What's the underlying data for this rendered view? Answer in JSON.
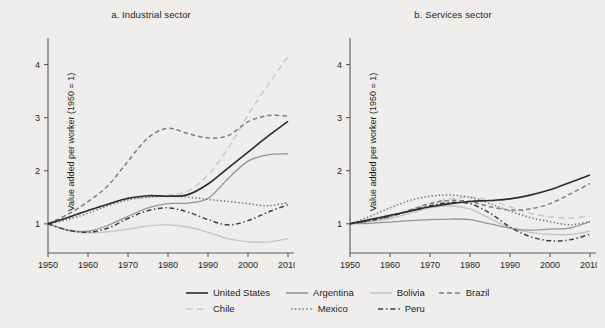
{
  "chart_data": {
    "type": "line",
    "ylabel": "Value added per worker (1950 = 1)",
    "xlabel": "",
    "xlim": [
      1950,
      2010
    ],
    "ylim": [
      0.45,
      4.35
    ],
    "yticks": [
      1,
      2,
      3,
      4
    ],
    "xticks": [
      1950,
      1960,
      1970,
      1980,
      1990,
      2000,
      2010
    ],
    "grid": false,
    "legend_position": "bottom",
    "x": [
      1950,
      1955,
      1960,
      1965,
      1970,
      1975,
      1980,
      1985,
      1990,
      1995,
      2000,
      2005,
      2010
    ],
    "panels": [
      {
        "key": "industrial",
        "title": "a. Industrial sector",
        "series": [
          {
            "name": "United States",
            "style": "solid",
            "color": "#2b2b2b",
            "width": 1.6,
            "values": [
              1.0,
              1.12,
              1.25,
              1.37,
              1.48,
              1.53,
              1.52,
              1.55,
              1.75,
              2.05,
              2.35,
              2.65,
              2.93
            ]
          },
          {
            "name": "Argentina",
            "style": "solid",
            "color": "#949494",
            "width": 1.3,
            "values": [
              1.0,
              0.88,
              0.86,
              0.97,
              1.14,
              1.3,
              1.38,
              1.39,
              1.48,
              1.85,
              2.18,
              2.3,
              2.32
            ]
          },
          {
            "name": "Bolivia",
            "style": "solid",
            "color": "#c3c3c3",
            "width": 1.3,
            "values": [
              1.0,
              0.87,
              0.83,
              0.85,
              0.9,
              0.96,
              0.98,
              0.94,
              0.84,
              0.72,
              0.66,
              0.66,
              0.72
            ]
          },
          {
            "name": "Brazil",
            "style": "dashed",
            "color": "#7d7d7d",
            "width": 1.5,
            "values": [
              1.0,
              1.18,
              1.42,
              1.72,
              2.18,
              2.62,
              2.8,
              2.7,
              2.62,
              2.66,
              2.92,
              3.04,
              3.03
            ]
          },
          {
            "name": "Chile",
            "style": "longdash",
            "color": "#c9c9c9",
            "width": 1.5,
            "values": [
              1.0,
              1.1,
              1.25,
              1.38,
              1.46,
              1.5,
              1.54,
              1.62,
              1.92,
              2.42,
              3.05,
              3.62,
              4.15
            ]
          },
          {
            "name": "Mexico",
            "style": "dotted",
            "color": "#6f6f6f",
            "width": 1.5,
            "values": [
              1.0,
              1.08,
              1.2,
              1.34,
              1.45,
              1.5,
              1.52,
              1.5,
              1.46,
              1.42,
              1.38,
              1.34,
              1.4
            ]
          },
          {
            "name": "Peru",
            "style": "dashdot",
            "color": "#3d3d3d",
            "width": 1.5,
            "values": [
              1.0,
              0.88,
              0.84,
              0.92,
              1.1,
              1.25,
              1.3,
              1.22,
              1.08,
              0.98,
              1.06,
              1.22,
              1.36
            ]
          }
        ]
      },
      {
        "key": "services",
        "title": "b. Services sector",
        "series": [
          {
            "name": "United States",
            "style": "solid",
            "color": "#2b2b2b",
            "width": 1.6,
            "values": [
              1.0,
              1.08,
              1.16,
              1.24,
              1.32,
              1.38,
              1.42,
              1.44,
              1.47,
              1.54,
              1.64,
              1.78,
              1.92
            ]
          },
          {
            "name": "Argentina",
            "style": "solid",
            "color": "#949494",
            "width": 1.3,
            "values": [
              1.0,
              1.01,
              1.03,
              1.06,
              1.08,
              1.09,
              1.08,
              1.0,
              0.92,
              0.88,
              0.9,
              0.92,
              1.04
            ]
          },
          {
            "name": "Bolivia",
            "style": "solid",
            "color": "#c3c3c3",
            "width": 1.3,
            "values": [
              1.0,
              1.04,
              1.1,
              1.2,
              1.3,
              1.34,
              1.28,
              1.1,
              0.92,
              0.84,
              0.8,
              0.8,
              0.86
            ]
          },
          {
            "name": "Brazil",
            "style": "dashed",
            "color": "#7d7d7d",
            "width": 1.5,
            "values": [
              1.0,
              1.06,
              1.14,
              1.26,
              1.38,
              1.44,
              1.42,
              1.32,
              1.26,
              1.28,
              1.38,
              1.56,
              1.76
            ]
          },
          {
            "name": "Chile",
            "style": "longdash",
            "color": "#c9c9c9",
            "width": 1.5,
            "values": [
              1.0,
              1.06,
              1.14,
              1.26,
              1.38,
              1.47,
              1.5,
              1.44,
              1.32,
              1.2,
              1.13,
              1.11,
              1.14
            ]
          },
          {
            "name": "Mexico",
            "style": "dotted",
            "color": "#6f6f6f",
            "width": 1.5,
            "values": [
              1.0,
              1.14,
              1.3,
              1.44,
              1.52,
              1.54,
              1.5,
              1.38,
              1.24,
              1.12,
              1.04,
              0.98,
              1.04
            ]
          },
          {
            "name": "Peru",
            "style": "dashdot",
            "color": "#3d3d3d",
            "width": 1.5,
            "values": [
              1.0,
              1.06,
              1.14,
              1.24,
              1.34,
              1.4,
              1.38,
              1.2,
              0.94,
              0.76,
              0.68,
              0.7,
              0.8
            ]
          }
        ]
      }
    ],
    "legend": [
      {
        "name": "United States",
        "style": "solid",
        "color": "#2b2b2b"
      },
      {
        "name": "Argentina",
        "style": "solid",
        "color": "#949494"
      },
      {
        "name": "Bolivia",
        "style": "solid",
        "color": "#c3c3c3"
      },
      {
        "name": "Brazil",
        "style": "dashed",
        "color": "#7d7d7d"
      },
      {
        "name": "Chile",
        "style": "longdash",
        "color": "#c9c9c9"
      },
      {
        "name": "Mexico",
        "style": "dotted",
        "color": "#6f6f6f"
      },
      {
        "name": "Peru",
        "style": "dashdot",
        "color": "#3d3d3d"
      }
    ]
  }
}
